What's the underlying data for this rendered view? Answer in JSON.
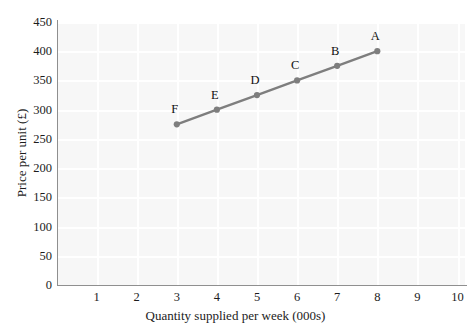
{
  "chart_data": {
    "type": "line",
    "title": "",
    "subtitle": "",
    "xlabel": "Quantity supplied per week (000s)",
    "ylabel": "Price per unit (£)",
    "xlim": [
      0,
      10
    ],
    "ylim": [
      0,
      450
    ],
    "xticks": [
      1,
      2,
      3,
      4,
      5,
      6,
      7,
      8,
      9,
      10
    ],
    "xtick_labels": [
      "1",
      "2",
      "3",
      "4",
      "5",
      "6",
      "7",
      "8",
      "9",
      "10"
    ],
    "yticks": [
      0,
      50,
      100,
      150,
      200,
      250,
      300,
      350,
      400,
      450
    ],
    "ytick_labels": [
      "0",
      "50",
      "100",
      "150",
      "200",
      "250",
      "300",
      "350",
      "400",
      "450"
    ],
    "grid": true,
    "grid_color": "#ffffff",
    "plot_background": "#f7f7f7",
    "axis_color": "#8f8f8f",
    "legend": null,
    "legend_position": "none",
    "series": [
      {
        "name": "Supply",
        "color": "#7e7e7e",
        "marker": "circle",
        "marker_color": "#7e7e7e",
        "x": [
          3,
          4,
          5,
          6,
          7,
          8
        ],
        "y": [
          275,
          300,
          325,
          350,
          375,
          400
        ],
        "point_labels": [
          "F",
          "E",
          "D",
          "C",
          "B",
          "A"
        ]
      }
    ],
    "annotations": [
      {
        "text": "F",
        "x": 3,
        "y": 275
      },
      {
        "text": "E",
        "x": 4,
        "y": 300
      },
      {
        "text": "D",
        "x": 5,
        "y": 325
      },
      {
        "text": "C",
        "x": 6,
        "y": 350
      },
      {
        "text": "B",
        "x": 7,
        "y": 375
      },
      {
        "text": "A",
        "x": 8,
        "y": 400
      }
    ]
  }
}
